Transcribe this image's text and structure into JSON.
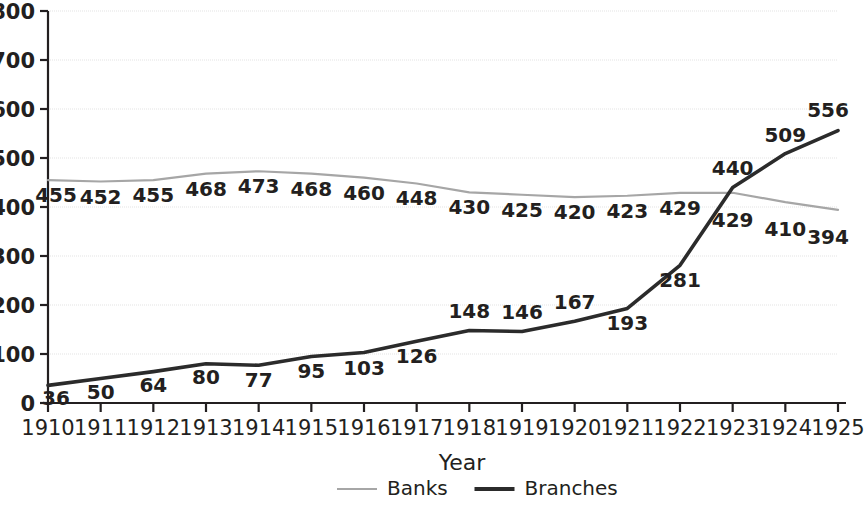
{
  "chart_data": {
    "type": "line",
    "title": "",
    "xlabel": "Year",
    "ylabel": "",
    "categories": [
      "1910",
      "1911",
      "1912",
      "1913",
      "1914",
      "1915",
      "1916",
      "1917",
      "1918",
      "1919",
      "1920",
      "1921",
      "1922",
      "1923",
      "1924",
      "1925"
    ],
    "x": [
      1910,
      1911,
      1912,
      1913,
      1914,
      1915,
      1916,
      1917,
      1918,
      1919,
      1920,
      1921,
      1922,
      1923,
      1924,
      1925
    ],
    "series": [
      {
        "name": "Banks",
        "color": "#a6a6a6",
        "values": [
          455,
          452,
          455,
          468,
          473,
          468,
          460,
          448,
          430,
          425,
          420,
          423,
          429,
          429,
          410,
          394
        ]
      },
      {
        "name": "Branches",
        "color": "#2b2b2b",
        "values": [
          36,
          50,
          64,
          80,
          77,
          95,
          103,
          126,
          148,
          146,
          167,
          193,
          281,
          440,
          509,
          556
        ]
      }
    ],
    "ylim": [
      0,
      800
    ],
    "yticks": [
      0,
      100,
      200,
      300,
      400,
      500,
      600,
      700,
      800
    ],
    "ytick_labels": [
      "0",
      "100",
      "200",
      "300",
      "400",
      "500",
      "600",
      "700",
      "800"
    ],
    "grid": true,
    "grid_color": "#e3e3e3",
    "legend_position": "bottom",
    "data_labels": true
  },
  "legend": {
    "items": [
      {
        "label": "Banks",
        "color": "#a6a6a6",
        "thickness": 2
      },
      {
        "label": "Branches",
        "color": "#2b2b2b",
        "thickness": 4
      }
    ]
  },
  "axis": {
    "x_title": "Year",
    "axis_color": "#231f20"
  },
  "label_offsets": {
    "banks": [
      22,
      22,
      22,
      22,
      22,
      22,
      22,
      22,
      22,
      22,
      22,
      22,
      22,
      34,
      34,
      34
    ],
    "branches": [
      20,
      20,
      20,
      20,
      22,
      22,
      22,
      22,
      -12,
      -12,
      -12,
      22,
      22,
      -12,
      -12,
      -14
    ]
  }
}
